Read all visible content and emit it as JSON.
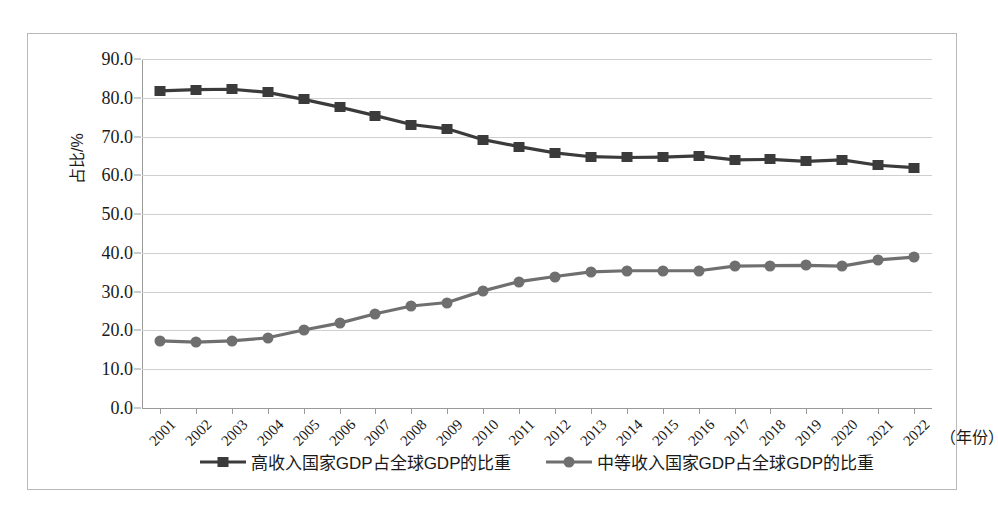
{
  "chart_data": {
    "type": "line",
    "title": "",
    "xlabel": "（年份）",
    "ylabel": "占比/%",
    "x": [
      2001,
      2002,
      2003,
      2004,
      2005,
      2006,
      2007,
      2008,
      2009,
      2010,
      2011,
      2012,
      2013,
      2014,
      2015,
      2016,
      2017,
      2018,
      2019,
      2020,
      2021,
      2022
    ],
    "categories": [
      "2001",
      "2002",
      "2003",
      "2004",
      "2005",
      "2006",
      "2007",
      "2008",
      "2009",
      "2010",
      "2011",
      "2012",
      "2013",
      "2014",
      "2015",
      "2016",
      "2017",
      "2018",
      "2019",
      "2020",
      "2021",
      "2022"
    ],
    "series": [
      {
        "name": "高收入国家GDP占全球GDP的比重",
        "marker": "square",
        "color": "#3b3b3b",
        "values": [
          81.8,
          82.1,
          82.2,
          81.4,
          79.6,
          77.6,
          75.4,
          73.1,
          72.0,
          69.2,
          67.4,
          65.8,
          64.8,
          64.6,
          64.7,
          65.0,
          64.0,
          64.1,
          63.6,
          64.0,
          62.6,
          62.0
        ]
      },
      {
        "name": "中等收入国家GDP占全球GDP的比重",
        "marker": "circle",
        "color": "#6f6f6f",
        "values": [
          17.3,
          17.0,
          17.3,
          18.1,
          20.1,
          21.9,
          24.3,
          26.3,
          27.2,
          30.2,
          32.6,
          33.9,
          35.1,
          35.4,
          35.4,
          35.4,
          36.6,
          36.7,
          36.8,
          36.6,
          38.2,
          38.9
        ]
      }
    ],
    "ylim": [
      0.0,
      90.0
    ],
    "ytick_values": [
      0.0,
      10.0,
      20.0,
      30.0,
      40.0,
      50.0,
      60.0,
      70.0,
      80.0,
      90.0
    ],
    "yticks": [
      "0.0",
      "10.0",
      "20.0",
      "30.0",
      "40.0",
      "50.0",
      "60.0",
      "70.0",
      "80.0",
      "90.0"
    ],
    "grid": true,
    "legend_position": "bottom"
  }
}
